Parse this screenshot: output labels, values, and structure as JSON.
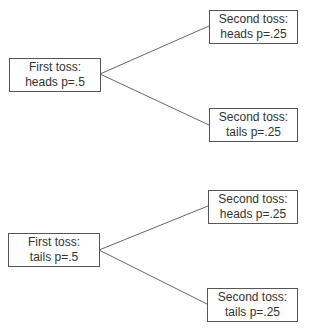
{
  "diagram": {
    "type": "probability-tree",
    "trees": [
      {
        "root": {
          "line1": "First toss:",
          "line2": "heads p=.5"
        },
        "children": [
          {
            "line1": "Second toss:",
            "line2": "heads p=.25"
          },
          {
            "line1": "Second toss:",
            "line2": "tails p=.25"
          }
        ]
      },
      {
        "root": {
          "line1": "First toss:",
          "line2": "tails p=.5"
        },
        "children": [
          {
            "line1": "Second toss:",
            "line2": "heads p=.25"
          },
          {
            "line1": "Second toss:",
            "line2": "tails p=.25"
          }
        ]
      }
    ],
    "colors": {
      "border": "#555555",
      "line": "#666666",
      "text": "#333333"
    }
  }
}
